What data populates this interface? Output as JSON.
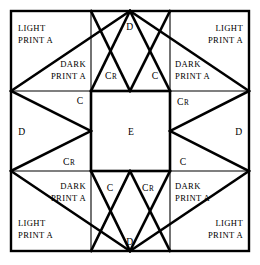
{
  "diagram": {
    "type": "quilt-block-piecing-diagram",
    "colors": {
      "line": "#000000",
      "background": "#ffffff"
    },
    "frame": {
      "left": 11,
      "top": 11,
      "right": 249,
      "bottom": 251
    },
    "grid": {
      "columns": 3,
      "rows": 3,
      "x_lines": [
        11,
        91,
        170,
        249
      ],
      "y_lines": [
        11,
        91,
        171,
        251
      ]
    },
    "labels": {
      "light_print_a_line1": "LIGHT",
      "light_print_a_line2": "PRINT A",
      "dark_print_a_line1": "DARK",
      "dark_print_a_line2": "PRINT A",
      "c": "C",
      "cr_main": "C",
      "cr_sub": "R",
      "d": "D",
      "e": "E"
    },
    "pieces": [
      {
        "id": "corner-top-left-light-a",
        "name": "light-print-a-top-left",
        "label_line1": "LIGHT",
        "label_line2": "PRINT A",
        "x": 18,
        "y": 24,
        "quadrant": "top-left"
      },
      {
        "id": "corner-top-right-light-a",
        "name": "light-print-a-top-right",
        "label_line1": "LIGHT",
        "label_line2": "PRINT A",
        "x": 208,
        "y": 24,
        "quadrant": "top-right"
      },
      {
        "id": "corner-bottom-left-light-a",
        "name": "light-print-a-bottom-left",
        "label_line1": "LIGHT",
        "label_line2": "PRINT A",
        "x": 18,
        "y": 228,
        "quadrant": "bottom-left"
      },
      {
        "id": "corner-bottom-right-light-a",
        "name": "light-print-a-bottom-right",
        "label_line1": "LIGHT",
        "label_line2": "PRINT A",
        "x": 208,
        "y": 228,
        "quadrant": "bottom-right"
      },
      {
        "id": "dark-a-top-left",
        "name": "dark-print-a-top-left",
        "label_line1": "DARK",
        "label_line2": "PRINT A",
        "x": 76,
        "y": 68,
        "quadrant": "top-left"
      },
      {
        "id": "dark-a-top-right",
        "name": "dark-print-a-top-right",
        "label_line1": "DARK",
        "label_line2": "PRINT A",
        "x": 186,
        "y": 68,
        "quadrant": "top-right"
      },
      {
        "id": "dark-a-bottom-left",
        "name": "dark-print-a-bottom-left",
        "label_line1": "DARK",
        "label_line2": "PRINT A",
        "x": 76,
        "y": 185,
        "quadrant": "bottom-left"
      },
      {
        "id": "dark-a-bottom-right",
        "name": "dark-print-a-bottom-right",
        "label_line1": "DARK",
        "label_line2": "PRINT A",
        "x": 186,
        "y": 185,
        "quadrant": "bottom-right"
      },
      {
        "id": "c-top-left",
        "name": "piece-c-top-left",
        "label": "C",
        "x": 78,
        "y": 101
      },
      {
        "id": "c-top-right",
        "name": "piece-c-top-right",
        "label": "C",
        "x": 153,
        "y": 75
      },
      {
        "id": "c-bottom-left",
        "name": "piece-c-bottom-left",
        "label": "C",
        "x": 108,
        "y": 188
      },
      {
        "id": "c-bottom-right",
        "name": "piece-c-bottom-right",
        "label": "C",
        "x": 181,
        "y": 162
      },
      {
        "id": "cr-top-left",
        "name": "piece-cr-top-left",
        "label": "CR",
        "x": 108,
        "y": 75
      },
      {
        "id": "cr-top-right",
        "name": "piece-cr-top-right",
        "label": "CR",
        "x": 180,
        "y": 101
      },
      {
        "id": "cr-bottom-left",
        "name": "piece-cr-bottom-left",
        "label": "CR",
        "x": 66,
        "y": 162
      },
      {
        "id": "cr-bottom-right",
        "name": "piece-cr-bottom-right",
        "label": "CR",
        "x": 145,
        "y": 188
      },
      {
        "id": "d-top",
        "name": "piece-d-top",
        "label": "D",
        "x": 127,
        "y": 24
      },
      {
        "id": "d-bottom",
        "name": "piece-d-bottom",
        "label": "D",
        "x": 127,
        "y": 244
      },
      {
        "id": "d-left",
        "name": "piece-d-left",
        "label": "D",
        "x": 19,
        "y": 134
      },
      {
        "id": "d-right",
        "name": "piece-d-right",
        "label": "D",
        "x": 238,
        "y": 134
      },
      {
        "id": "e-center",
        "name": "piece-e-center",
        "label": "E",
        "x": 130,
        "y": 134
      }
    ]
  }
}
